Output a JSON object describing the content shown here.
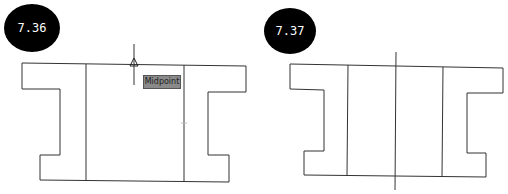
{
  "figures": [
    {
      "label": "7.36",
      "tooltip": "Midpoint"
    },
    {
      "label": "7.37"
    }
  ]
}
